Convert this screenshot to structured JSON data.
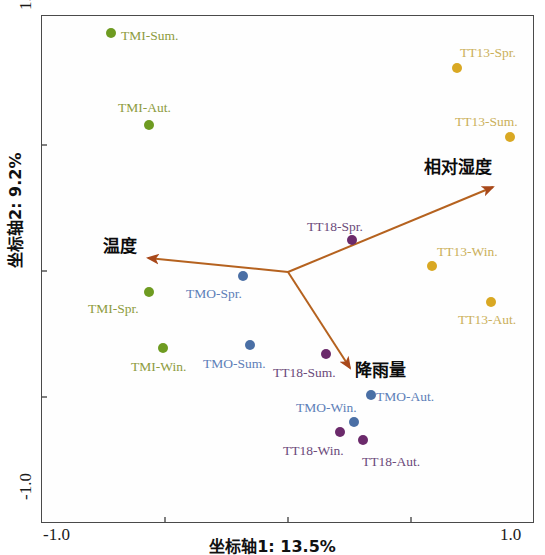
{
  "chart_data": {
    "type": "scatter",
    "title": "",
    "xlabel": "坐标轴1: 13.5%",
    "ylabel": "坐标轴2: 9.2%",
    "xlim": [
      -1.0,
      1.0
    ],
    "ylim": [
      -1.0,
      1.0
    ],
    "xticklabels": [
      "-1.0",
      "1.0"
    ],
    "yticklabels": [
      "1.0",
      "-1.0"
    ],
    "grid": false,
    "legend": "none",
    "groups": [
      {
        "name": "TMI",
        "color": "#6e9b21"
      },
      {
        "name": "TMO",
        "color": "#4a6fa5"
      },
      {
        "name": "TT13",
        "color": "#d9a823"
      },
      {
        "name": "TT18",
        "color": "#6b2a6b"
      }
    ],
    "points": [
      {
        "label": "TMI-Sum.",
        "x": -0.716,
        "y": 0.929,
        "group": "TMI",
        "color": "#6e9b21",
        "label_color": "#8d9b3d",
        "px": 111,
        "py": 33,
        "lx": 121,
        "ly": 29
      },
      {
        "label": "TMI-Aut.",
        "x": -0.562,
        "y": 0.567,
        "group": "TMI",
        "color": "#6e9b21",
        "label_color": "#8d9b3d",
        "px": 149,
        "py": 125,
        "lx": 118,
        "ly": 101
      },
      {
        "label": "TMI-Spr.",
        "x": -0.562,
        "y": -0.091,
        "group": "TMI",
        "color": "#6e9b21",
        "label_color": "#8d9b3d",
        "px": 149,
        "py": 292,
        "lx": 88,
        "ly": 302
      },
      {
        "label": "TMI-Win.",
        "x": -0.506,
        "y": -0.311,
        "group": "TMI",
        "color": "#6e9b21",
        "label_color": "#8d9b3d",
        "px": 163,
        "py": 348,
        "lx": 131,
        "ly": 360
      },
      {
        "label": "TMO-Spr.",
        "x": -0.182,
        "y": 0.028,
        "group": "TMO",
        "color": "#4a6fa5",
        "label_color": "#5d7fb8",
        "px": 243,
        "py": 276,
        "lx": 186,
        "ly": 287
      },
      {
        "label": "TMO-Sum.",
        "x": -0.154,
        "y": -0.299,
        "group": "TMO",
        "color": "#4a6fa5",
        "label_color": "#5d7fb8",
        "px": 250,
        "py": 345,
        "lx": 203,
        "ly": 357
      },
      {
        "label": "TMO-Aut.",
        "x": 0.337,
        "y": -0.496,
        "group": "TMO",
        "color": "#4a6fa5",
        "label_color": "#5d7fb8",
        "px": 371,
        "py": 395,
        "lx": 376,
        "ly": 390
      },
      {
        "label": "TMO-Win.",
        "x": 0.268,
        "y": -0.626,
        "group": "TMO",
        "color": "#4a6fa5",
        "label_color": "#5d7fb8",
        "px": 354,
        "py": 422,
        "lx": 296,
        "ly": 401
      },
      {
        "label": "TT13-Spr.",
        "x": 0.69,
        "y": 0.795,
        "group": "TT13",
        "color": "#d9a823",
        "label_color": "#cbb05a",
        "px": 457,
        "py": 68,
        "lx": 460,
        "ly": 46
      },
      {
        "label": "TT13-Sum.",
        "x": 0.905,
        "y": 0.524,
        "group": "TT13",
        "color": "#d9a823",
        "label_color": "#cbb05a",
        "px": 510,
        "py": 137,
        "lx": 455,
        "ly": 115
      },
      {
        "label": "TT13-Win.",
        "x": 0.589,
        "y": -0.024,
        "group": "TT13",
        "color": "#d9a823",
        "label_color": "#cbb05a",
        "px": 432,
        "py": 266,
        "lx": 437,
        "ly": 245
      },
      {
        "label": "TT13-Aut.",
        "x": 0.828,
        "y": -0.165,
        "group": "TT13",
        "color": "#d9a823",
        "label_color": "#cbb05a",
        "px": 491,
        "py": 302,
        "lx": 458,
        "ly": 313
      },
      {
        "label": "TT18-Spr.",
        "x": 0.26,
        "y": 0.083,
        "group": "TT18",
        "color": "#6b2a6b",
        "label_color": "#6b4a7a",
        "px": 352,
        "py": 240,
        "lx": 307,
        "ly": 220
      },
      {
        "label": "TT18-Sum.",
        "x": 0.154,
        "y": -0.366,
        "group": "TT18",
        "color": "#6b2a6b",
        "label_color": "#6b4a7a",
        "px": 326,
        "py": 354,
        "lx": 273,
        "ly": 366
      },
      {
        "label": "TT18-Win.",
        "x": 0.211,
        "y": -0.665,
        "group": "TT18",
        "color": "#6b2a6b",
        "label_color": "#6b4a7a",
        "px": 340,
        "py": 432,
        "lx": 283,
        "ly": 444
      },
      {
        "label": "TT18-Aut.",
        "x": 0.305,
        "y": -0.697,
        "group": "TT18",
        "color": "#6b2a6b",
        "label_color": "#6b4a7a",
        "px": 363,
        "py": 440,
        "lx": 362,
        "ly": 455
      }
    ],
    "vectors": [
      {
        "name": "温度",
        "origin_px": [
          288,
          272
        ],
        "tip_px": [
          148,
          258
        ],
        "label_lx": 103,
        "label_ly": 232,
        "color": "#b5621f"
      },
      {
        "name": "相对湿度",
        "origin_px": [
          288,
          272
        ],
        "tip_px": [
          493,
          187
        ],
        "label_lx": 424,
        "label_ly": 153,
        "color": "#b5621f"
      },
      {
        "name": "降雨量",
        "origin_px": [
          288,
          272
        ],
        "tip_px": [
          350,
          368
        ],
        "label_lx": 355,
        "label_ly": 356,
        "color": "#b5621f"
      }
    ],
    "axis_corner_labels": {
      "y_top": "1.0",
      "y_bottom": "-1.0",
      "x_left": "-1.0",
      "x_right": "1.0"
    },
    "tick_positions_px": {
      "x": [
        165,
        288,
        411
      ],
      "y": [
        145,
        271,
        397
      ]
    }
  },
  "accent_color": "#b5621f",
  "frame_color": "#4a4a4a"
}
